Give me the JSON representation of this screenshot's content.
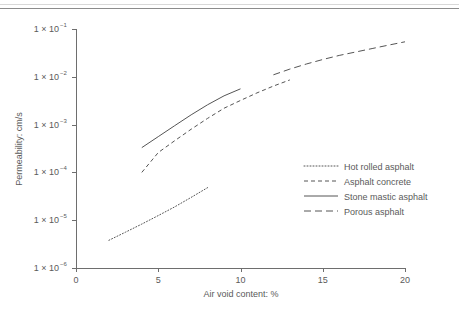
{
  "figure": {
    "has_top_rule": true,
    "background_color": "#ffffff",
    "line_color": "#555555",
    "axis_color": "#6e6e6e",
    "text_color": "#5a5a5a"
  },
  "chart_data": {
    "type": "line",
    "title": "",
    "subtitle": "",
    "xlabel": "Air void content: %",
    "ylabel": "Permeability: cm/s",
    "xlim": [
      0,
      20
    ],
    "ylim": [
      1e-06,
      0.1
    ],
    "yscale": "log",
    "xscale": "linear",
    "grid": false,
    "legend_position": "center right",
    "xticks": [
      0,
      5,
      10,
      15,
      20
    ],
    "xtick_labels": [
      "0",
      "5",
      "10",
      "15",
      "20"
    ],
    "yticks": [
      1e-06,
      1e-05,
      0.0001,
      0.001,
      0.01,
      0.1
    ],
    "ytick_labels": [
      {
        "mantissa": "1 × 10",
        "exponent": "−6"
      },
      {
        "mantissa": "1 × 10",
        "exponent": "−5"
      },
      {
        "mantissa": "1 × 10",
        "exponent": "−4"
      },
      {
        "mantissa": "1 × 10",
        "exponent": "−3"
      },
      {
        "mantissa": "1 × 10",
        "exponent": "−2"
      },
      {
        "mantissa": "1 × 10",
        "exponent": "−1"
      }
    ],
    "series": [
      {
        "name": "Hot rolled asphalt",
        "style": "dotted",
        "dasharray": "1,2",
        "x": [
          2.0,
          3.0,
          4.0,
          5.0,
          6.0,
          7.0,
          8.0
        ],
        "y": [
          3.8e-06,
          5.6e-06,
          8.3e-06,
          1.25e-05,
          1.9e-05,
          3e-05,
          4.8e-05
        ]
      },
      {
        "name": "Asphalt concrete",
        "style": "dashed-short",
        "dasharray": "4,3",
        "x": [
          4.0,
          5.0,
          6.0,
          7.0,
          8.0,
          9.0,
          10.0,
          11.0,
          12.0,
          13.0
        ],
        "y": [
          0.0001,
          0.00026,
          0.00046,
          0.0008,
          0.00135,
          0.0022,
          0.0032,
          0.0046,
          0.0064,
          0.0086
        ]
      },
      {
        "name": "Stone mastic asphalt",
        "style": "solid",
        "dasharray": "",
        "x": [
          4.0,
          5.0,
          6.0,
          7.0,
          8.0,
          9.0,
          10.0
        ],
        "y": [
          0.00033,
          0.00056,
          0.00095,
          0.0016,
          0.0026,
          0.004,
          0.0056
        ]
      },
      {
        "name": "Porous asphalt",
        "style": "dashed-long",
        "dasharray": "7,4",
        "x": [
          12.0,
          13.0,
          14.0,
          15.0,
          16.0,
          17.0,
          18.0,
          19.0,
          20.0
        ],
        "y": [
          0.011,
          0.0145,
          0.0185,
          0.023,
          0.028,
          0.033,
          0.039,
          0.046,
          0.054
        ]
      }
    ],
    "legend_entries": [
      {
        "label": "Hot rolled asphalt",
        "style": "dotted"
      },
      {
        "label": "Asphalt concrete",
        "style": "dashed-short"
      },
      {
        "label": "Stone mastic asphalt",
        "style": "solid"
      },
      {
        "label": "Porous asphalt",
        "style": "dashed-long"
      }
    ]
  }
}
